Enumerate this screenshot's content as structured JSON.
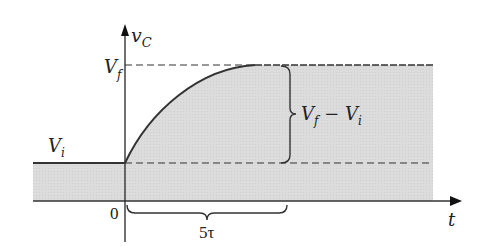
{
  "diagram": {
    "type": "rc-charging-curve",
    "colors": {
      "fill": "#d9d9d9",
      "line": "#333333",
      "dashed": "#333333"
    },
    "axes": {
      "y_label_main": "v",
      "y_label_sub": "C",
      "x_label": "t",
      "origin_label": "0"
    },
    "levels": {
      "final_main": "V",
      "final_sub": "f",
      "initial_main": "V",
      "initial_sub": "i"
    },
    "annotations": {
      "difference_a": "V",
      "difference_a_sub": "f",
      "difference_op": " − ",
      "difference_b": "V",
      "difference_b_sub": "i",
      "duration": "5τ"
    }
  }
}
